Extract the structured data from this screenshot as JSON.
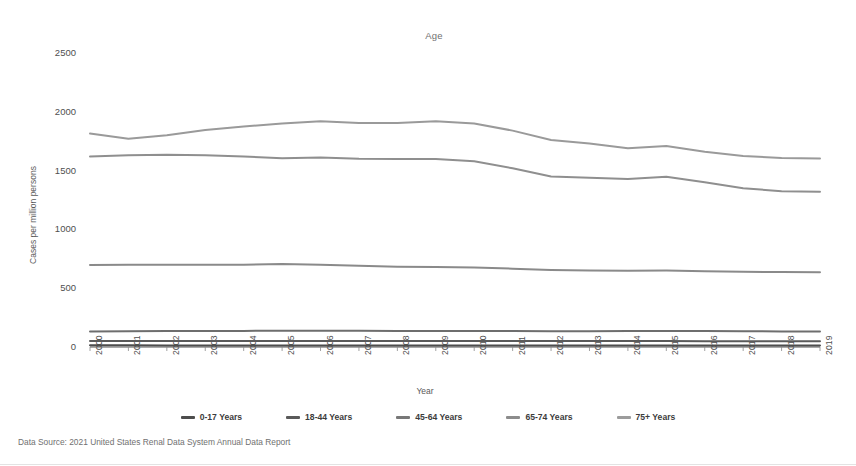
{
  "chart_data": {
    "type": "line",
    "title": "Age",
    "xlabel": "Year",
    "ylabel": "Cases per million persons",
    "grid": false,
    "legend_position": "bottom",
    "ylim": [
      0,
      2500
    ],
    "yticks": [
      0,
      500,
      1000,
      1500,
      2000,
      2500
    ],
    "x": [
      2000,
      2001,
      2002,
      2003,
      2004,
      2005,
      2006,
      2007,
      2008,
      2009,
      2010,
      2011,
      2012,
      2013,
      2014,
      2015,
      2016,
      2017,
      2018,
      2019
    ],
    "categories": [
      "2000",
      "2001",
      "2002",
      "2003",
      "2004",
      "2005",
      "2006",
      "2007",
      "2008",
      "2009",
      "2010",
      "2011",
      "2012",
      "2013",
      "2014",
      "2015",
      "2016",
      "2017",
      "2018",
      "2019"
    ],
    "series": [
      {
        "name": "0-17 Years",
        "color": "#4d4d4d",
        "values": [
          14,
          14,
          13,
          13,
          13,
          13,
          13,
          13,
          12,
          12,
          12,
          12,
          12,
          12,
          12,
          12,
          12,
          12,
          12,
          12
        ]
      },
      {
        "name": "18-44 Years",
        "color": "#5a5a5a",
        "values": [
          52,
          52,
          52,
          52,
          52,
          52,
          52,
          52,
          51,
          51,
          50,
          50,
          50,
          50,
          50,
          50,
          49,
          49,
          48,
          48
        ]
      },
      {
        "name": "45-64 Years",
        "color": "#6e6e6e",
        "values": [
          132,
          134,
          135,
          136,
          137,
          138,
          138,
          138,
          137,
          137,
          136,
          135,
          134,
          134,
          136,
          137,
          136,
          134,
          132,
          131
        ]
      },
      {
        "name": "65-74 Years",
        "color": "#8a8a8a",
        "values": [
          697,
          700,
          700,
          700,
          700,
          705,
          700,
          690,
          683,
          680,
          676,
          666,
          655,
          650,
          648,
          650,
          645,
          640,
          637,
          635
        ]
      },
      {
        "name": "75+ Years",
        "color": "#9a9a9a",
        "values": [
          1815,
          1770,
          1800,
          1845,
          1875,
          1900,
          1920,
          1905,
          1905,
          1920,
          1900,
          1840,
          1760,
          1730,
          1690,
          1710,
          1660,
          1625,
          1608,
          1602
        ]
      },
      {
        "name": "45-64 Years (upper band)",
        "color": "#8f8f8f",
        "values": [
          1620,
          1630,
          1635,
          1630,
          1620,
          1605,
          1612,
          1600,
          1598,
          1598,
          1580,
          1520,
          1450,
          1440,
          1428,
          1448,
          1400,
          1350,
          1325,
          1320
        ],
        "hidden_duplicate": true
      }
    ]
  },
  "legend": {
    "items": [
      {
        "label": "0-17 Years",
        "color": "#4d4d4d"
      },
      {
        "label": "18-44 Years",
        "color": "#5a5a5a"
      },
      {
        "label": "45-64 Years",
        "color": "#787878"
      },
      {
        "label": "65-74 Years",
        "color": "#8c8c8c"
      },
      {
        "label": "75+ Years",
        "color": "#9c9c9c"
      }
    ]
  },
  "footer": {
    "source_note": "Data Source: 2021 United States Renal Data System Annual Data Report"
  }
}
